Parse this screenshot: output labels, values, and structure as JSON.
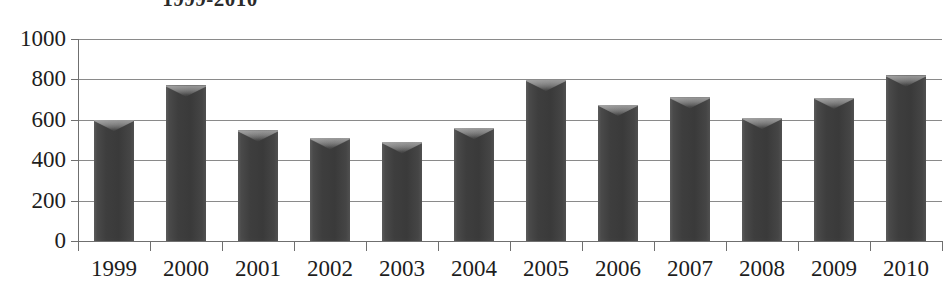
{
  "chart_data": {
    "type": "bar",
    "title": "1999-2010",
    "xlabel": "",
    "ylabel": "",
    "categories": [
      "1999",
      "2000",
      "2001",
      "2002",
      "2003",
      "2004",
      "2005",
      "2006",
      "2007",
      "2008",
      "2009",
      "2010"
    ],
    "values": [
      600,
      770,
      548,
      510,
      490,
      560,
      798,
      675,
      712,
      610,
      710,
      820
    ],
    "series": [
      {
        "name": "series-1",
        "values": [
          600,
          770,
          548,
          510,
          490,
          560,
          798,
          675,
          712,
          610,
          710,
          820
        ]
      }
    ],
    "ylim": [
      0,
      1000
    ],
    "y_ticks": [
      0,
      200,
      400,
      600,
      800,
      1000
    ],
    "y_tick_labels": [
      "0",
      "200",
      "400",
      "600",
      "800",
      "1000"
    ],
    "grid": true,
    "grid_axis": "y",
    "legend": false,
    "legend_position": "none",
    "bar_color": "#3e3e3e",
    "grid_color": "#8a8a8a",
    "axis_color": "#6f6f6f",
    "text_color": "#1d1d1d",
    "background_color": "#ffffff"
  }
}
